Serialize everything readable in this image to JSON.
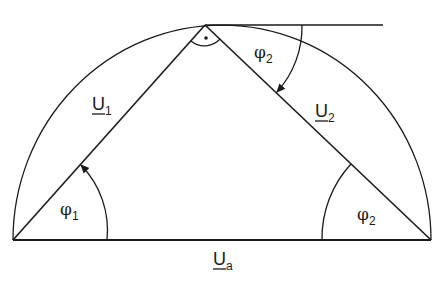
{
  "diagram": {
    "type": "phasor-triangle-in-semicircle",
    "labels": {
      "u1": {
        "main": "U",
        "sub": "1"
      },
      "u2": {
        "main": "U",
        "sub": "2"
      },
      "ua": {
        "main": "U",
        "sub": "a"
      },
      "phi1": {
        "main": "φ",
        "sub": "1"
      },
      "phi2_bottom": {
        "main": "φ",
        "sub": "2"
      },
      "phi2_top": {
        "main": "φ",
        "sub": "2"
      }
    },
    "right_angle_marker": "·",
    "colors": {
      "stroke": "#1a1a1a",
      "background": "#ffffff"
    }
  }
}
